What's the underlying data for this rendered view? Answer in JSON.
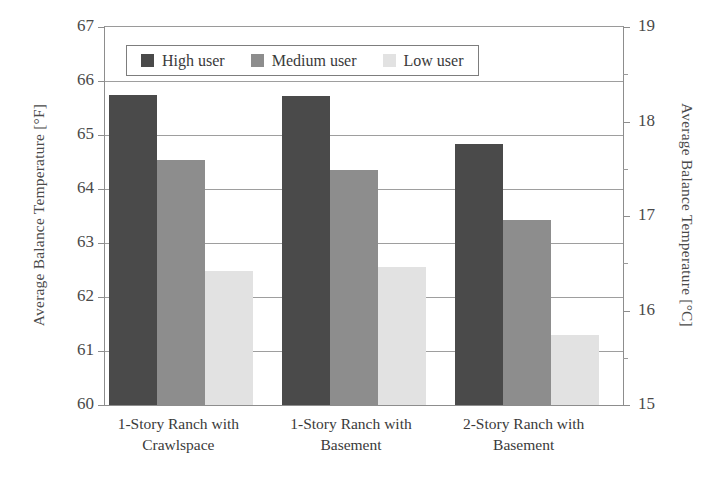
{
  "chart_data": {
    "type": "bar",
    "title": "",
    "xlabel": "",
    "ylabel": "Average Balance Temperature [°F]",
    "ylabel_secondary": "Average Balance Temperature [°C]",
    "categories": [
      "1-Story Ranch with Crawlspace",
      "1-Story Ranch with Basement",
      "2-Story Ranch with Basement"
    ],
    "categories_lines": [
      [
        "1-Story Ranch with",
        "Crawlspace"
      ],
      [
        "1-Story Ranch with",
        "Basement"
      ],
      [
        "2-Story Ranch with",
        "Basement"
      ]
    ],
    "series": [
      {
        "name": "High user",
        "values": [
          65.75,
          65.72,
          64.83
        ],
        "color": "#4a4a4a"
      },
      {
        "name": "Medium user",
        "values": [
          64.53,
          64.35,
          63.42
        ],
        "color": "#8d8d8d"
      },
      {
        "name": "Low user",
        "values": [
          62.48,
          62.56,
          61.3
        ],
        "color": "#e2e2e2"
      }
    ],
    "ylim": [
      60,
      67
    ],
    "yticks": [
      60,
      61,
      62,
      63,
      64,
      65,
      66,
      67
    ],
    "ytick_labels": [
      "60",
      "61",
      "62",
      "63",
      "64",
      "65",
      "66",
      "67"
    ],
    "ylim_secondary": [
      15.0,
      19.0
    ],
    "yticks_secondary": [
      15,
      16,
      17,
      18,
      19
    ],
    "ytick_labels_secondary": [
      "15",
      "16",
      "17",
      "18",
      "19"
    ],
    "yticks_secondary_minor": [
      15.5,
      16.5,
      17.5,
      18.5
    ],
    "grid": true,
    "grid_axis": "y",
    "legend": {
      "position": "top-center",
      "entries": [
        "High user",
        "Medium user",
        "Low user"
      ]
    }
  }
}
